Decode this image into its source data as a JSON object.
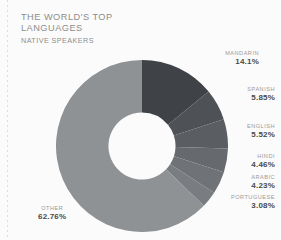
{
  "header": {
    "title": "THE WORLD'S TOP\nLANGUAGES",
    "subtitle": "NATIVE SPEAKERS"
  },
  "chart_data": {
    "type": "pie",
    "variant": "donut",
    "title": "THE WORLD'S TOP LANGUAGES",
    "subtitle": "NATIVE SPEAKERS",
    "unit": "percent",
    "start_angle_deg": 0,
    "direction": "clockwise",
    "inner_radius_ratio": 0.39,
    "categories": [
      "Mandarin",
      "Spanish",
      "English",
      "Hindi",
      "Arabic",
      "Portuguese",
      "Other"
    ],
    "values": [
      14.1,
      5.85,
      5.52,
      4.46,
      4.23,
      3.08,
      62.76
    ],
    "labels": [
      "14.1%",
      "5.85%",
      "5.52%",
      "4.46%",
      "4.23%",
      "3.08%",
      "62.76%"
    ],
    "colors": [
      "#3f4246",
      "#4e5257",
      "#5a5e63",
      "#666a6f",
      "#6f7378",
      "#797d82",
      "#8f9295"
    ],
    "legend": "none",
    "grid": false,
    "slices": [
      {
        "name": "MANDARIN",
        "label": "MANDARIN",
        "value": 14.1,
        "pct": "14.1%",
        "color": "#3f4246"
      },
      {
        "name": "SPANISH",
        "label": "SPANISH",
        "value": 5.85,
        "pct": "5.85%",
        "color": "#4e5257"
      },
      {
        "name": "ENGLISH",
        "label": "ENGLISH",
        "value": 5.52,
        "pct": "5.52%",
        "color": "#5a5e63"
      },
      {
        "name": "HINDI",
        "label": "HINDI",
        "value": 4.46,
        "pct": "4.46%",
        "color": "#666a6f"
      },
      {
        "name": "ARABIC",
        "label": "ARABIC",
        "value": 4.23,
        "pct": "4.23%",
        "color": "#6f7378"
      },
      {
        "name": "PORTUGUESE",
        "label": "PORTUGUESE",
        "value": 3.08,
        "pct": "3.08%",
        "color": "#797d82"
      },
      {
        "name": "OTHER",
        "label": "OTHER",
        "value": 62.76,
        "pct": "62.76%",
        "color": "#8f9295"
      }
    ]
  },
  "style": {
    "background": "#fbfbfb",
    "title_color": "#8d8d8d",
    "label_name_color": "#9a9a9a",
    "label_value_color": "#4a4a4a"
  }
}
